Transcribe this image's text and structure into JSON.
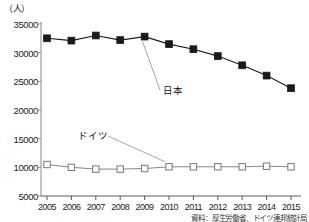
{
  "chart_data": {
    "type": "line",
    "title": "",
    "subtitle": "",
    "unit_label": "（人）",
    "xlabel": "",
    "ylabel": "",
    "categories": [
      "2005",
      "2006",
      "2007",
      "2008",
      "2009",
      "2010",
      "2011",
      "2012",
      "2013",
      "2014",
      "2015"
    ],
    "ylim": [
      5000,
      35000
    ],
    "ytick_values": [
      5000,
      10000,
      15000,
      20000,
      25000,
      30000,
      35000
    ],
    "ytick_labels": [
      "5000",
      "10000",
      "15000",
      "20000",
      "25000",
      "30000",
      "35000"
    ],
    "grid": false,
    "legend_position": "inline-annotations",
    "series": [
      {
        "name": "日本",
        "marker": "filled-square",
        "color": "#1a1a1a",
        "values": [
          32500,
          32100,
          33000,
          32200,
          32800,
          31500,
          30600,
          29400,
          27800,
          26000,
          23800
        ]
      },
      {
        "name": "ドイツ",
        "marker": "open-square",
        "color": "#777777",
        "values": [
          10500,
          10000,
          9700,
          9700,
          9800,
          10100,
          10100,
          10100,
          10100,
          10200,
          10100
        ]
      }
    ],
    "annotations": [
      {
        "text": "日本",
        "attached_series": "日本"
      },
      {
        "text": "ドイツ",
        "attached_series": "ドイツ"
      }
    ],
    "source_note": "資料：厚生労働省、ドイツ連邦統計局"
  }
}
